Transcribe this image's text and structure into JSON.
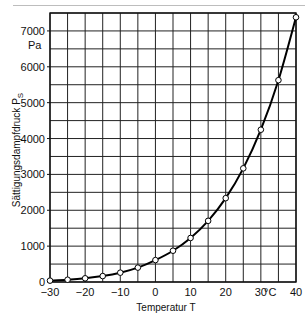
{
  "chart_data": {
    "type": "line",
    "title": "",
    "xlabel": "Temperatur T",
    "x_unit": "°C",
    "ylabel": "Sättigungsdampfdruck P",
    "ylabel_subscript": "S",
    "y_unit": "Pa",
    "xlim": [
      -30,
      40
    ],
    "ylim": [
      0,
      7500
    ],
    "x_ticks": [
      -30,
      -20,
      -10,
      0,
      10,
      20,
      30,
      40
    ],
    "x_tick_labels": [
      "−30",
      "−20",
      "−10",
      "0",
      "10",
      "20",
      "30",
      "40"
    ],
    "y_ticks": [
      0,
      1000,
      2000,
      3000,
      4000,
      5000,
      6000,
      7000
    ],
    "y_tick_labels": [
      "0",
      "1000",
      "2000",
      "3000",
      "4000",
      "5000",
      "6000",
      "7000"
    ],
    "grid": true,
    "grid_x_step": 5,
    "grid_y_step": 500,
    "legend": null,
    "series": [
      {
        "name": "Sättigungsdampfdruck",
        "marker": "open-circle",
        "x": [
          -30,
          -25,
          -20,
          -15,
          -10,
          -5,
          0,
          5,
          10,
          15,
          20,
          25,
          30,
          35,
          40
        ],
        "values": [
          38,
          63,
          103,
          165,
          260,
          401,
          611,
          872,
          1228,
          1705,
          2338,
          3169,
          4246,
          5627,
          7381
        ]
      }
    ]
  },
  "labels": {
    "x_title": "Temperatur T",
    "x_unit": "°C",
    "y_title": "Sättigungsdampfdruck  P",
    "y_sub": "S",
    "y_unit": "Pa"
  }
}
